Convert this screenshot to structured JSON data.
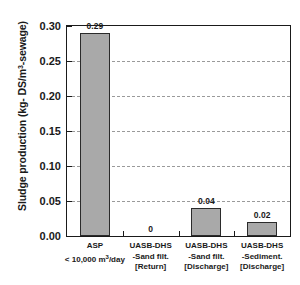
{
  "chart_data": {
    "type": "bar",
    "title": "",
    "xlabel": "",
    "ylabel": "Sludge production  (kg- DS/m3-sewage)",
    "ylabel_parts": {
      "prefix": "Sludge production  (kg- DS/m",
      "exponent": "3",
      "suffix": "-sewage)"
    },
    "categories": [
      "ASP\n< 10,000 m3/day",
      "UASB-DHS\n-Sand filt.\n[Return]",
      "UASB-DHS\n-Sand filt.\n[Discharge]",
      "UASB-DHS\n-Sediment.\n[Discharge]"
    ],
    "category_lines": [
      [
        "ASP",
        "< 10,000 m",
        "/day"
      ],
      [
        "UASB-DHS",
        "-Sand filt.",
        "[Return]"
      ],
      [
        "UASB-DHS",
        "-Sand filt.",
        "[Discharge]"
      ],
      [
        "UASB-DHS",
        "-Sediment.",
        "[Discharge]"
      ]
    ],
    "values": [
      0.29,
      0,
      0.04,
      0.02
    ],
    "value_labels": [
      "0.29",
      "0",
      "0.04",
      "0.02"
    ],
    "ylim": [
      0.0,
      0.3
    ],
    "ytick_values": [
      0.0,
      0.05,
      0.1,
      0.15,
      0.2,
      0.25,
      0.3
    ],
    "ytick_labels": [
      "0.00",
      "0.05",
      "0.10",
      "0.15",
      "0.20",
      "0.25",
      "0.30"
    ],
    "grid": "horizontal-dashed",
    "legend": "none",
    "bar_color": "#a9a9a9",
    "bar_edge_color": "#2b2b2b",
    "axis_color": "#1a1a1a",
    "grid_color": "#9a9a9a"
  }
}
